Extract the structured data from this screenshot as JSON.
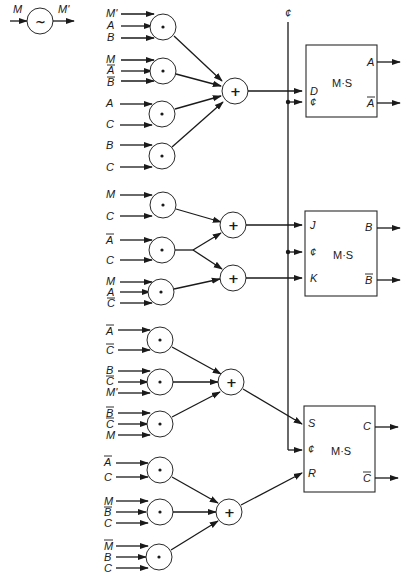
{
  "inverter": {
    "input": "M",
    "output": "M'",
    "symbol": "~"
  },
  "clock": {
    "label": "¢"
  },
  "sections": [
    {
      "flipflop": {
        "type": "D",
        "label": "M·S",
        "inputs": [
          "D",
          "¢"
        ],
        "outputs": [
          "A",
          "A"
        ],
        "output_bars": [
          false,
          true
        ]
      },
      "or_symbol": "+",
      "and_gates": [
        {
          "inputs": [
            {
              "t": "M'",
              "bar": false
            },
            {
              "t": "A",
              "bar": false
            },
            {
              "t": "B",
              "bar": false
            }
          ]
        },
        {
          "inputs": [
            {
              "t": "M",
              "bar": false
            },
            {
              "t": "A",
              "bar": true
            },
            {
              "t": "B",
              "bar": true
            }
          ]
        },
        {
          "inputs": [
            {
              "t": "A",
              "bar": false
            },
            {
              "t": "C",
              "bar": false
            }
          ]
        },
        {
          "inputs": [
            {
              "t": "B",
              "bar": false
            },
            {
              "t": "C",
              "bar": false
            }
          ]
        }
      ]
    },
    {
      "flipflop": {
        "type": "JK",
        "label": "M·S",
        "inputs": [
          "J",
          "¢",
          "K"
        ],
        "outputs": [
          "B",
          "B"
        ],
        "output_bars": [
          false,
          true
        ]
      },
      "or_symbol": "+",
      "and_gates": [
        {
          "inputs": [
            {
              "t": "M",
              "bar": false
            },
            {
              "t": "C",
              "bar": false
            }
          ]
        },
        {
          "inputs": [
            {
              "t": "A",
              "bar": true
            },
            {
              "t": "C",
              "bar": false
            }
          ]
        },
        {
          "inputs": [
            {
              "t": "M",
              "bar": false
            },
            {
              "t": "A",
              "bar": true
            },
            {
              "t": "C",
              "bar": true
            }
          ]
        }
      ]
    },
    {
      "flipflop": {
        "type": "SR",
        "label": "M·S",
        "inputs": [
          "S",
          "¢",
          "R"
        ],
        "outputs": [
          "C",
          "C"
        ],
        "output_bars": [
          false,
          true
        ]
      },
      "or_symbol": "+",
      "and_gates": [
        {
          "inputs": [
            {
              "t": "A",
              "bar": true
            },
            {
              "t": "C",
              "bar": true
            }
          ]
        },
        {
          "inputs": [
            {
              "t": "B",
              "bar": true
            },
            {
              "t": "C",
              "bar": true
            },
            {
              "t": "M'",
              "bar": false
            }
          ]
        },
        {
          "inputs": [
            {
              "t": "B",
              "bar": true
            },
            {
              "t": "C",
              "bar": true
            },
            {
              "t": "M",
              "bar": false
            }
          ]
        },
        {
          "inputs": [
            {
              "t": "A",
              "bar": true
            },
            {
              "t": "C",
              "bar": false
            }
          ]
        },
        {
          "inputs": [
            {
              "t": "M",
              "bar": false
            },
            {
              "t": "B",
              "bar": true
            },
            {
              "t": "C",
              "bar": false
            }
          ]
        },
        {
          "inputs": [
            {
              "t": "M",
              "bar": true
            },
            {
              "t": "B",
              "bar": false
            },
            {
              "t": "C",
              "bar": false
            }
          ]
        }
      ]
    }
  ],
  "and_symbol": "•"
}
